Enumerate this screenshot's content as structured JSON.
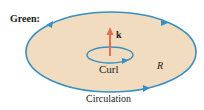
{
  "title": "Green:",
  "labels": {
    "vector": "k",
    "curl": "Curl",
    "region": "R",
    "circulation": "Circulation"
  },
  "colors": {
    "region_fill": "#f2dcc0",
    "boundary": "#3a8fc2",
    "vector_arrow": "#e07050",
    "text": "#222222"
  }
}
